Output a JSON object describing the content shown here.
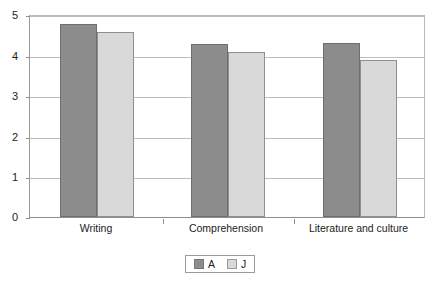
{
  "chart_data": {
    "type": "bar",
    "title": "",
    "xlabel": "",
    "ylabel": "",
    "categories": [
      "Writing",
      "Comprehension",
      "Literature and culture"
    ],
    "series": [
      {
        "name": "A",
        "values": [
          4.8,
          4.3,
          4.33
        ],
        "color": "#8c8c8c"
      },
      {
        "name": "J",
        "values": [
          4.6,
          4.1,
          3.9
        ],
        "color": "#d9d9d9"
      }
    ],
    "ylim": [
      0,
      5
    ],
    "yticks": [
      0,
      1,
      2,
      3,
      4,
      5
    ],
    "ytick_labels": [
      "0",
      "1",
      "2",
      "3",
      "4",
      "5"
    ],
    "grid": true,
    "legend_position": "bottom-center"
  },
  "legend": {
    "entries": [
      {
        "label": "A",
        "swatch": "series-a-swatch"
      },
      {
        "label": "J",
        "swatch": "series-j-swatch"
      }
    ]
  },
  "axis": {
    "y_labels": [
      "5",
      "4",
      "3",
      "2",
      "1",
      "0"
    ],
    "x_labels": [
      "Writing",
      "Comprehension",
      "Literature and culture"
    ]
  }
}
